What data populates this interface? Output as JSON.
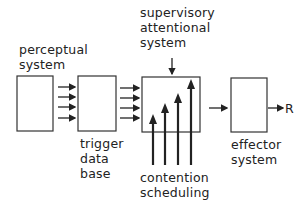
{
  "labels": {
    "perceptual": "perceptual\nsystem",
    "supervisory": "supervisory\nattentional\nsystem",
    "trigger": "trigger\ndata\nbase",
    "contention": "contention\nscheduling",
    "effector": "effector\nsystem",
    "output": "R"
  }
}
